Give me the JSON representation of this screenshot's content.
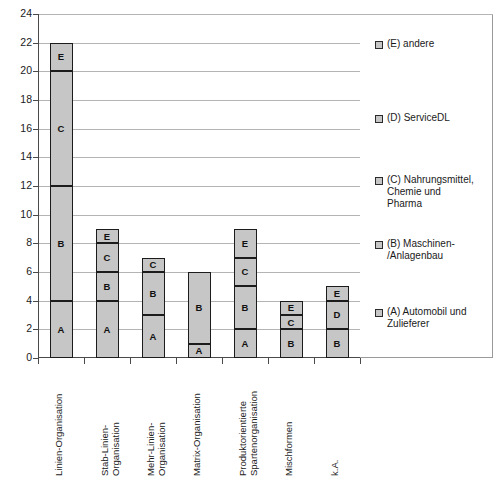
{
  "chart_data": {
    "type": "bar",
    "subtype": "stacked-bar",
    "title": "",
    "xlabel": "",
    "ylabel": "",
    "ylim": [
      0,
      24
    ],
    "ytick_step": 2,
    "yticks": [
      0,
      2,
      4,
      6,
      8,
      10,
      12,
      14,
      16,
      18,
      20,
      22,
      24
    ],
    "grid": true,
    "legend_position": "right",
    "categories": [
      "Linien-Organisation",
      "Stab-Linien-Organisation",
      "Mehr-Linien-Organisation",
      "Matrix-Organisation",
      "Produktorientierte Spartenorganisation",
      "Mischformen",
      "k.A."
    ],
    "category_lines": [
      [
        "Linien-Organisation",
        ""
      ],
      [
        "Stab-Linien-",
        "Organisation"
      ],
      [
        "Mehr-Linien-",
        "Organisation"
      ],
      [
        "Matrix-Organisation",
        ""
      ],
      [
        "Produktorientierte",
        "Spartenorganisation"
      ],
      [
        "Mischformen",
        ""
      ],
      [
        "k.A.",
        ""
      ]
    ],
    "series": [
      {
        "name": "(A) Automobil und Zulieferer",
        "key": "A",
        "values": [
          4,
          4,
          3,
          1,
          2,
          0,
          0
        ]
      },
      {
        "name": "(B) Maschinen-/Anlagenbau",
        "key": "B",
        "values": [
          8,
          2,
          3,
          5,
          3,
          2,
          2
        ]
      },
      {
        "name": "(C) Nahrungsmittel, Chemie und Pharma",
        "key": "C",
        "values": [
          8,
          2,
          1,
          0,
          2,
          1,
          0
        ]
      },
      {
        "name": "(D) ServiceDL",
        "key": "D",
        "values": [
          0,
          0,
          0,
          0,
          0,
          0,
          2
        ]
      },
      {
        "name": "(E) andere",
        "key": "E",
        "values": [
          2,
          1,
          0,
          0,
          2,
          1,
          1
        ]
      }
    ],
    "totals": [
      22,
      9,
      7,
      6,
      9,
      4,
      5
    ],
    "colors": {
      "bar_fill": "#c6c6c6",
      "bar_border": "#1c1c1c",
      "gridline": "#b4b4b4",
      "axis": "#4a4a4a"
    }
  },
  "legend": {
    "items": [
      {
        "marker": "legend-swatch-e",
        "lines": [
          "(E) andere"
        ]
      },
      {
        "marker": "legend-swatch-d",
        "lines": [
          "(D) ServiceDL"
        ]
      },
      {
        "marker": "legend-swatch-c",
        "lines": [
          "(C) Nahrungsmittel,",
          "Chemie und",
          "Pharma"
        ]
      },
      {
        "marker": "legend-swatch-b",
        "lines": [
          "(B) Maschinen-",
          "/Anlagenbau"
        ]
      },
      {
        "marker": "legend-swatch-a",
        "lines": [
          "(A) Automobil und",
          "Zulieferer"
        ]
      }
    ]
  }
}
